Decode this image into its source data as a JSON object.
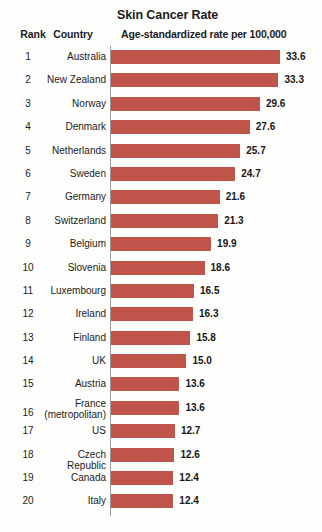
{
  "header": {
    "title": "Skin Cancer Rate",
    "subtitle": "Age-standardized rate per 100,000",
    "rank_column": "Rank",
    "country_column": "Country"
  },
  "chart_data": {
    "type": "bar",
    "orientation": "horizontal",
    "title": "Skin Cancer Rate",
    "subtitle": "Age-standardized rate per 100,000",
    "xlabel": "",
    "ylabel": "",
    "grid": false,
    "legend": null,
    "xlim": [
      0,
      33.6
    ],
    "bar_color": "#bf554a",
    "categories": [
      "Australia",
      "New Zealand",
      "Norway",
      "Denmark",
      "Netherlands",
      "Sweden",
      "Germany",
      "Switzerland",
      "Belgium",
      "Slovenia",
      "Luxembourg",
      "Ireland",
      "Finland",
      "UK",
      "Austria",
      "France (metropolitan)",
      "US",
      "Czech Republic",
      "Canada",
      "Italy"
    ],
    "values": [
      33.6,
      33.3,
      29.6,
      27.6,
      25.7,
      24.7,
      21.6,
      21.3,
      19.9,
      18.6,
      16.5,
      16.3,
      15.8,
      15.0,
      13.6,
      13.6,
      12.7,
      12.6,
      12.4,
      12.4
    ],
    "ranks": [
      1,
      2,
      3,
      4,
      5,
      6,
      7,
      8,
      9,
      10,
      11,
      12,
      13,
      14,
      15,
      16,
      17,
      18,
      19,
      20
    ]
  },
  "rows": [
    {
      "rank": "1",
      "country_line1": "Australia",
      "country_line2": "",
      "value": 33.6,
      "value_label": "33.6"
    },
    {
      "rank": "2",
      "country_line1": "New Zealand",
      "country_line2": "",
      "value": 33.3,
      "value_label": "33.3"
    },
    {
      "rank": "3",
      "country_line1": "Norway",
      "country_line2": "",
      "value": 29.6,
      "value_label": "29.6"
    },
    {
      "rank": "4",
      "country_line1": "Denmark",
      "country_line2": "",
      "value": 27.6,
      "value_label": "27.6"
    },
    {
      "rank": "5",
      "country_line1": "Netherlands",
      "country_line2": "",
      "value": 25.7,
      "value_label": "25.7"
    },
    {
      "rank": "6",
      "country_line1": "Sweden",
      "country_line2": "",
      "value": 24.7,
      "value_label": "24.7"
    },
    {
      "rank": "7",
      "country_line1": "Germany",
      "country_line2": "",
      "value": 21.6,
      "value_label": "21.6"
    },
    {
      "rank": "8",
      "country_line1": "Switzerland",
      "country_line2": "",
      "value": 21.3,
      "value_label": "21.3"
    },
    {
      "rank": "9",
      "country_line1": "Belgium",
      "country_line2": "",
      "value": 19.9,
      "value_label": "19.9"
    },
    {
      "rank": "10",
      "country_line1": "Slovenia",
      "country_line2": "",
      "value": 18.6,
      "value_label": "18.6"
    },
    {
      "rank": "11",
      "country_line1": "Luxembourg",
      "country_line2": "",
      "value": 16.5,
      "value_label": "16.5"
    },
    {
      "rank": "12",
      "country_line1": "Ireland",
      "country_line2": "",
      "value": 16.3,
      "value_label": "16.3"
    },
    {
      "rank": "13",
      "country_line1": "Finland",
      "country_line2": "",
      "value": 15.8,
      "value_label": "15.8"
    },
    {
      "rank": "14",
      "country_line1": "UK",
      "country_line2": "",
      "value": 15.0,
      "value_label": "15.0"
    },
    {
      "rank": "15",
      "country_line1": "Austria",
      "country_line2": "",
      "value": 13.6,
      "value_label": "13.6"
    },
    {
      "rank": "16",
      "country_line1": "France",
      "country_line2": "(metropolitan)",
      "value": 13.6,
      "value_label": "13.6"
    },
    {
      "rank": "17",
      "country_line1": "US",
      "country_line2": "",
      "value": 12.7,
      "value_label": "12.7"
    },
    {
      "rank": "18",
      "country_line1": "Czech Republic",
      "country_line2": "",
      "value": 12.6,
      "value_label": "12.6"
    },
    {
      "rank": "19",
      "country_line1": "Canada",
      "country_line2": "",
      "value": 12.4,
      "value_label": "12.4"
    },
    {
      "rank": "20",
      "country_line1": "Italy",
      "country_line2": "",
      "value": 12.4,
      "value_label": "12.4"
    }
  ]
}
